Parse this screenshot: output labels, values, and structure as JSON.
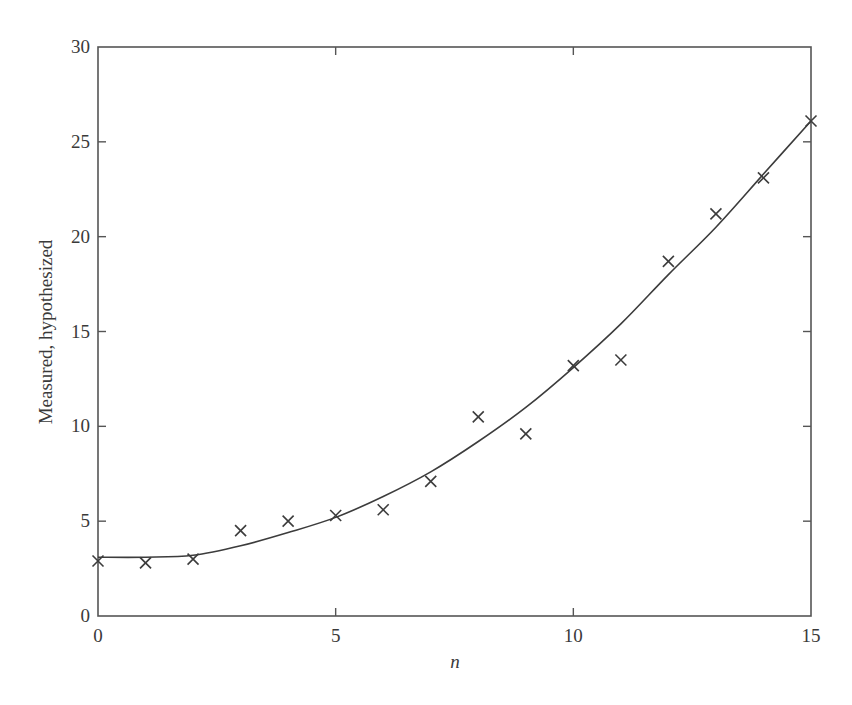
{
  "chart_data": {
    "type": "scatter",
    "title": "",
    "xlabel": "n",
    "ylabel": "Measured, hypothesized",
    "xlim": [
      0,
      15
    ],
    "ylim": [
      0,
      30
    ],
    "x_ticks": [
      0,
      5,
      10,
      15
    ],
    "y_ticks": [
      0,
      5,
      10,
      15,
      20,
      25,
      30
    ],
    "grid": false,
    "legend": null,
    "series": [
      {
        "name": "Measured",
        "style": "x-markers",
        "x": [
          0,
          1,
          2,
          3,
          4,
          5,
          6,
          7,
          8,
          9,
          10,
          11,
          12,
          13,
          14,
          15
        ],
        "values": [
          2.9,
          2.8,
          3.0,
          4.5,
          5.0,
          5.3,
          5.6,
          7.1,
          10.5,
          9.6,
          13.2,
          13.5,
          18.7,
          21.2,
          23.1,
          26.1
        ]
      },
      {
        "name": "Hypothesized",
        "style": "line",
        "x": [
          0,
          1,
          2,
          3,
          4,
          5,
          6,
          7,
          8,
          9,
          10,
          11,
          12,
          13,
          14,
          15
        ],
        "values": [
          3.1,
          3.1,
          3.2,
          3.7,
          4.4,
          5.2,
          6.3,
          7.6,
          9.2,
          11.0,
          13.1,
          15.4,
          18.0,
          20.5,
          23.3,
          26.1
        ]
      }
    ]
  },
  "colors": {
    "ink": "#3c3c3c",
    "frame": "#555555",
    "background": "#ffffff"
  }
}
